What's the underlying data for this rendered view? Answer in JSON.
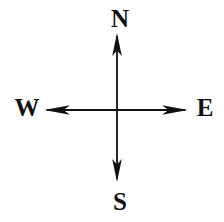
{
  "figure": {
    "name": "compass-direction-diagram",
    "background_color": "#ffffff",
    "stroke_color": "#111111",
    "width": 224,
    "height": 222,
    "center": {
      "x": 117,
      "y": 110
    }
  },
  "labels": {
    "north": "N",
    "south": "S",
    "west": "W",
    "east": "E"
  },
  "axes": {
    "vertical": {
      "name": "north-south-axis",
      "x": 117,
      "y_start": 33,
      "y_end": 182,
      "double_headed": true
    },
    "horizontal": {
      "name": "east-west-axis",
      "y": 110,
      "x_start": 44,
      "x_end": 188,
      "double_headed": true
    }
  },
  "arrowheads": {
    "north": {
      "tip_x": 117,
      "tip_y": 33
    },
    "south": {
      "tip_x": 117,
      "tip_y": 182
    },
    "west": {
      "tip_x": 44,
      "tip_y": 110
    },
    "east": {
      "tip_x": 188,
      "tip_y": 110
    }
  }
}
